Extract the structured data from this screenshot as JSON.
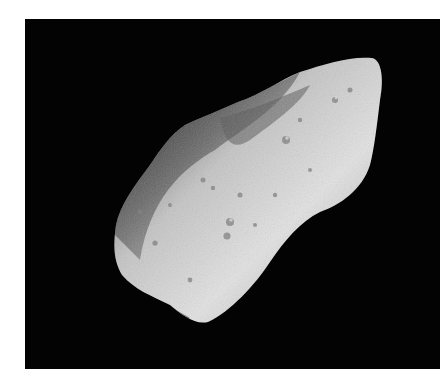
{
  "image": {
    "subject": "asteroid",
    "description": "Grayscale photograph of an elongated, cratered asteroid against a black space background",
    "colors": {
      "background": "#030303",
      "surface_light": "#e6e6e6",
      "surface_mid": "#a8a8a8",
      "surface_shadow": "#3a3a3a",
      "page": "#ffffff"
    }
  }
}
